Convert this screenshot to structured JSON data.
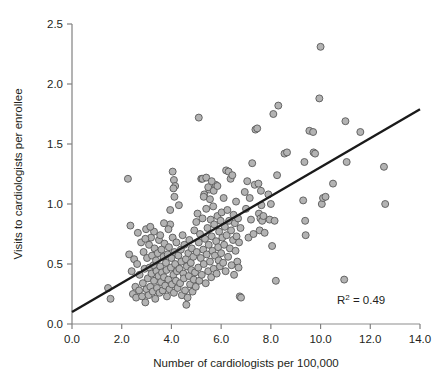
{
  "chart_data": {
    "type": "scatter",
    "title": "",
    "xlabel": "Number of cardiologists per 100,000",
    "ylabel": "Visits to cardiologists per enrollee",
    "xlim": [
      0.0,
      14.0
    ],
    "ylim": [
      0.0,
      2.5
    ],
    "xticks": [
      "0.0",
      "2.0",
      "4.0",
      "6.0",
      "8.0",
      "10.0",
      "12.0",
      "14.0"
    ],
    "xtick_values": [
      0.0,
      2.0,
      4.0,
      6.0,
      8.0,
      10.0,
      12.0,
      14.0
    ],
    "yticks": [
      "0.0",
      "0.5",
      "1.0",
      "1.5",
      "2.0",
      "2.5"
    ],
    "ytick_values": [
      0.0,
      0.5,
      1.0,
      1.5,
      2.0,
      2.5
    ],
    "grid": false,
    "legend": null,
    "annotations": [
      {
        "name": "r-squared",
        "text_prefix": "R",
        "text_sup": "2",
        "text_suffix": " = 0.49",
        "value": 0.49,
        "x": 12.6,
        "y": 0.17
      }
    ],
    "trendline": {
      "type": "line",
      "name": "regression-line",
      "x": [
        0.0,
        14.0
      ],
      "y": [
        0.1,
        1.79
      ],
      "slope": 0.1207,
      "intercept": 0.1,
      "color": "#1a1a1a",
      "width": 2.4
    },
    "marker_style": {
      "shape": "circle",
      "fill": "#b3b3b3",
      "stroke": "#595959",
      "stroke_width": 0.9,
      "radius": 3.5
    },
    "series": [
      {
        "name": "Hospital referral regions",
        "points": [
          [
            1.45,
            0.3
          ],
          [
            1.55,
            0.21
          ],
          [
            2.25,
            1.21
          ],
          [
            2.3,
            0.58
          ],
          [
            2.35,
            0.82
          ],
          [
            2.4,
            0.44
          ],
          [
            2.45,
            0.25
          ],
          [
            2.5,
            0.54
          ],
          [
            2.55,
            0.31
          ],
          [
            2.58,
            0.22
          ],
          [
            2.62,
            0.5
          ],
          [
            2.65,
            0.76
          ],
          [
            2.7,
            0.28
          ],
          [
            2.72,
            0.41
          ],
          [
            2.78,
            0.68
          ],
          [
            2.82,
            0.23
          ],
          [
            2.85,
            0.34
          ],
          [
            2.88,
            0.6
          ],
          [
            2.92,
            0.46
          ],
          [
            2.95,
            0.18
          ],
          [
            2.98,
            0.79
          ],
          [
            3.0,
            0.29
          ],
          [
            3.02,
            0.55
          ],
          [
            3.05,
            0.38
          ],
          [
            3.08,
            0.24
          ],
          [
            3.1,
            0.66
          ],
          [
            3.12,
            0.47
          ],
          [
            3.15,
            0.31
          ],
          [
            3.18,
            0.72
          ],
          [
            3.2,
            0.42
          ],
          [
            3.22,
            0.57
          ],
          [
            3.25,
            0.27
          ],
          [
            3.28,
            0.49
          ],
          [
            3.3,
            0.36
          ],
          [
            3.32,
            0.63
          ],
          [
            3.35,
            0.21
          ],
          [
            3.38,
            0.53
          ],
          [
            3.4,
            0.44
          ],
          [
            3.42,
            0.3
          ],
          [
            3.45,
            0.59
          ],
          [
            3.48,
            0.4
          ],
          [
            3.5,
            0.7
          ],
          [
            3.52,
            0.26
          ],
          [
            3.55,
            0.48
          ],
          [
            3.58,
            0.35
          ],
          [
            3.6,
            0.62
          ],
          [
            3.62,
            0.43
          ],
          [
            3.65,
            0.28
          ],
          [
            3.68,
            0.56
          ],
          [
            3.7,
            0.39
          ],
          [
            3.72,
            0.67
          ],
          [
            3.75,
            0.32
          ],
          [
            3.78,
            0.51
          ],
          [
            3.8,
            0.45
          ],
          [
            3.82,
            0.23
          ],
          [
            3.85,
            0.58
          ],
          [
            3.88,
            0.37
          ],
          [
            3.9,
            0.64
          ],
          [
            3.92,
            0.29
          ],
          [
            3.95,
            0.95
          ],
          [
            3.98,
            0.47
          ],
          [
            4.0,
            0.55
          ],
          [
            4.02,
            0.33
          ],
          [
            4.05,
            0.72
          ],
          [
            4.08,
            0.41
          ],
          [
            4.1,
            0.26
          ],
          [
            4.12,
            0.6
          ],
          [
            4.15,
            0.5
          ],
          [
            4.18,
            0.36
          ],
          [
            4.2,
            0.68
          ],
          [
            4.22,
            0.44
          ],
          [
            4.25,
            0.3
          ],
          [
            4.28,
            0.57
          ],
          [
            4.3,
            0.99
          ],
          [
            4.32,
            0.46
          ],
          [
            4.35,
            0.34
          ],
          [
            4.38,
            0.62
          ],
          [
            4.4,
            0.52
          ],
          [
            4.42,
            0.24
          ],
          [
            4.45,
            0.74
          ],
          [
            4.48,
            0.42
          ],
          [
            4.5,
            0.38
          ],
          [
            4.52,
            0.66
          ],
          [
            4.55,
            0.28
          ],
          [
            4.58,
            0.54
          ],
          [
            4.6,
            0.16
          ],
          [
            4.62,
            0.48
          ],
          [
            4.65,
            0.22
          ],
          [
            4.68,
            0.59
          ],
          [
            4.7,
            0.4
          ],
          [
            4.72,
            0.7
          ],
          [
            4.75,
            0.33
          ],
          [
            4.78,
            0.51
          ],
          [
            4.8,
            0.45
          ],
          [
            4.82,
            0.63
          ],
          [
            4.85,
            0.27
          ],
          [
            4.88,
            0.56
          ],
          [
            4.9,
            0.37
          ],
          [
            4.92,
            0.78
          ],
          [
            4.95,
            0.43
          ],
          [
            4.98,
            0.31
          ],
          [
            5.0,
            0.85
          ],
          [
            4.05,
            1.27
          ],
          [
            4.1,
            1.2
          ],
          [
            4.15,
            1.15
          ],
          [
            4.12,
            1.06
          ],
          [
            4.08,
            1.13
          ],
          [
            3.95,
            0.83
          ],
          [
            3.88,
            0.79
          ],
          [
            3.7,
            0.84
          ],
          [
            3.55,
            0.74
          ],
          [
            3.3,
            0.77
          ],
          [
            3.15,
            0.81
          ],
          [
            2.95,
            0.71
          ],
          [
            5.02,
            0.6
          ],
          [
            5.05,
            0.92
          ],
          [
            5.08,
            0.47
          ],
          [
            5.1,
            0.68
          ],
          [
            5.12,
            0.36
          ],
          [
            5.15,
            0.75
          ],
          [
            5.18,
            0.55
          ],
          [
            5.2,
            1.21
          ],
          [
            5.22,
            0.41
          ],
          [
            5.25,
            0.88
          ],
          [
            5.28,
            0.62
          ],
          [
            5.3,
            0.5
          ],
          [
            5.32,
            1.08
          ],
          [
            5.35,
            0.71
          ],
          [
            5.38,
            0.34
          ],
          [
            5.4,
            0.96
          ],
          [
            5.42,
            0.58
          ],
          [
            5.45,
            0.8
          ],
          [
            5.48,
            0.44
          ],
          [
            5.5,
            0.66
          ],
          [
            5.52,
            1.12
          ],
          [
            5.55,
            0.52
          ],
          [
            5.58,
            0.87
          ],
          [
            5.6,
            0.39
          ],
          [
            5.62,
            0.73
          ],
          [
            5.65,
            0.61
          ],
          [
            5.68,
            0.98
          ],
          [
            5.7,
            0.46
          ],
          [
            5.72,
            0.83
          ],
          [
            5.75,
            0.57
          ],
          [
            5.78,
            1.16
          ],
          [
            5.8,
            0.69
          ],
          [
            5.82,
            0.42
          ],
          [
            5.85,
            0.9
          ],
          [
            5.88,
            0.64
          ],
          [
            5.9,
            0.53
          ],
          [
            5.92,
            0.77
          ],
          [
            5.95,
            0.48
          ],
          [
            5.98,
            0.86
          ],
          [
            6.0,
            0.59
          ],
          [
            5.1,
            1.72
          ],
          [
            5.25,
            1.21
          ],
          [
            5.3,
            1.06
          ],
          [
            5.4,
            1.22
          ],
          [
            5.48,
            1.14
          ],
          [
            5.55,
            1.04
          ],
          [
            5.62,
            1.19
          ],
          [
            5.7,
            1.11
          ],
          [
            5.85,
            1.15
          ],
          [
            6.02,
            0.93
          ],
          [
            6.05,
            0.72
          ],
          [
            6.08,
            0.51
          ],
          [
            6.1,
            1.05
          ],
          [
            6.12,
            0.66
          ],
          [
            6.15,
            0.81
          ],
          [
            6.18,
            0.44
          ],
          [
            6.2,
            1.28
          ],
          [
            6.22,
            0.74
          ],
          [
            6.25,
            0.95
          ],
          [
            6.28,
            0.56
          ],
          [
            6.3,
            1.27
          ],
          [
            6.32,
            0.86
          ],
          [
            6.35,
            0.63
          ],
          [
            6.38,
            1.21
          ],
          [
            6.4,
            0.78
          ],
          [
            6.42,
            0.49
          ],
          [
            6.45,
            1.24
          ],
          [
            6.48,
            0.7
          ],
          [
            6.5,
            0.91
          ],
          [
            6.52,
            0.41
          ],
          [
            6.55,
            0.84
          ],
          [
            6.58,
            0.61
          ],
          [
            6.6,
            1.02
          ],
          [
            6.62,
            0.73
          ],
          [
            6.65,
            0.52
          ],
          [
            6.68,
            0.88
          ],
          [
            6.7,
            0.47
          ],
          [
            6.72,
            0.68
          ],
          [
            6.75,
            0.23
          ],
          [
            6.78,
            0.8
          ],
          [
            6.8,
            0.22
          ],
          [
            6.95,
            1.1
          ],
          [
            7.0,
            0.96
          ],
          [
            7.05,
            1.19
          ],
          [
            7.1,
            0.72
          ],
          [
            7.15,
            1.05
          ],
          [
            7.2,
            0.87
          ],
          [
            7.25,
            1.34
          ],
          [
            7.3,
            0.75
          ],
          [
            7.35,
            1.16
          ],
          [
            7.38,
            1.62
          ],
          [
            7.45,
            1.63
          ],
          [
            7.5,
            1.17
          ],
          [
            7.52,
            0.92
          ],
          [
            7.55,
            0.78
          ],
          [
            7.58,
            0.88
          ],
          [
            7.6,
            1.11
          ],
          [
            7.62,
            0.99
          ],
          [
            7.65,
            0.86
          ],
          [
            7.7,
            0.9
          ],
          [
            7.75,
            0.76
          ],
          [
            7.9,
            1.08
          ],
          [
            7.95,
            0.87
          ],
          [
            8.0,
            1.0
          ],
          [
            8.05,
            0.65
          ],
          [
            8.1,
            1.75
          ],
          [
            8.15,
            0.86
          ],
          [
            8.2,
            0.36
          ],
          [
            8.25,
            1.24
          ],
          [
            8.3,
            1.82
          ],
          [
            8.55,
            1.42
          ],
          [
            8.65,
            1.43
          ],
          [
            9.3,
            1.03
          ],
          [
            9.35,
            1.35
          ],
          [
            9.38,
            0.86
          ],
          [
            9.4,
            0.74
          ],
          [
            9.55,
            1.61
          ],
          [
            9.7,
            1.6
          ],
          [
            9.72,
            1.43
          ],
          [
            9.78,
            1.42
          ],
          [
            9.95,
            1.88
          ],
          [
            10.0,
            2.31
          ],
          [
            10.05,
            1.0
          ],
          [
            10.1,
            1.05
          ],
          [
            10.2,
            1.06
          ],
          [
            10.5,
            1.17
          ],
          [
            10.95,
            0.37
          ],
          [
            11.0,
            1.69
          ],
          [
            11.05,
            1.35
          ],
          [
            11.6,
            1.6
          ],
          [
            12.55,
            1.31
          ],
          [
            12.6,
            1.0
          ]
        ]
      }
    ]
  },
  "axes": {
    "x_axis_name": "x-axis",
    "y_axis_name": "y-axis",
    "axis_color": "#b3b3b3",
    "tick_color": "#808080",
    "text_color": "#231f20"
  }
}
